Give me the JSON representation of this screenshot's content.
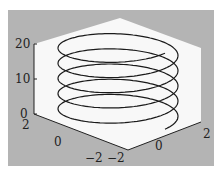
{
  "chart_data": {
    "type": "line3d",
    "title": "",
    "series": [
      {
        "name": "helix",
        "x_expr": "2*cos(t)",
        "y_expr": "2*sin(t)",
        "z_expr": "t",
        "t_range": [
          0,
          20
        ],
        "turns": 5
      }
    ],
    "xlabel": "",
    "ylabel": "",
    "zlabel": "",
    "x_ticks": [
      "-2",
      "0",
      "2"
    ],
    "y_ticks": [
      "-2",
      "0",
      "2"
    ],
    "z_ticks": [
      "0",
      "10",
      "20"
    ],
    "xlim": [
      -2,
      2
    ],
    "ylim": [
      -2,
      2
    ],
    "zlim": [
      0,
      20
    ],
    "grid": false,
    "colors": {
      "figure_bg": "#b4b4b4",
      "axes_bg": "#f8f8f8",
      "line": "#1a1a1a"
    }
  },
  "labels": {
    "z_20": "20",
    "z_10": "10",
    "z_0": "0",
    "y_2": "2",
    "y_0": "0",
    "y_m2": "−2",
    "x_m2": "−2",
    "x_0": "0",
    "x_2": "2"
  }
}
